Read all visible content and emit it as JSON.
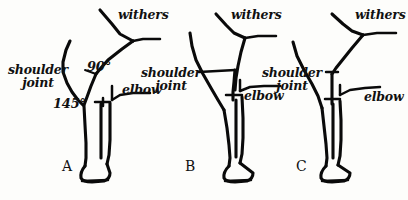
{
  "diagram": {
    "background_color": "#fdfdfb",
    "ink_color": "#0a0a0a",
    "figures": [
      {
        "id": "A",
        "letter": "A",
        "labels": {
          "withers": "withers",
          "shoulder_joint_line1": "shoulder",
          "shoulder_joint_line2": "joint",
          "elbow": "elbow"
        },
        "angles": [
          {
            "name": "shoulder-angle",
            "value": "90°"
          },
          {
            "name": "elbow-angle",
            "value": "145°"
          }
        ]
      },
      {
        "id": "B",
        "letter": "B",
        "labels": {
          "withers": "withers",
          "shoulder_joint_line1": "shoulder",
          "shoulder_joint_line2": "joint",
          "elbow": "elbow"
        },
        "angles": []
      },
      {
        "id": "C",
        "letter": "C",
        "labels": {
          "withers": "withers",
          "shoulder_joint_line1": "shoulder",
          "shoulder_joint_line2": "joint",
          "elbow": "elbow"
        },
        "angles": []
      }
    ]
  }
}
